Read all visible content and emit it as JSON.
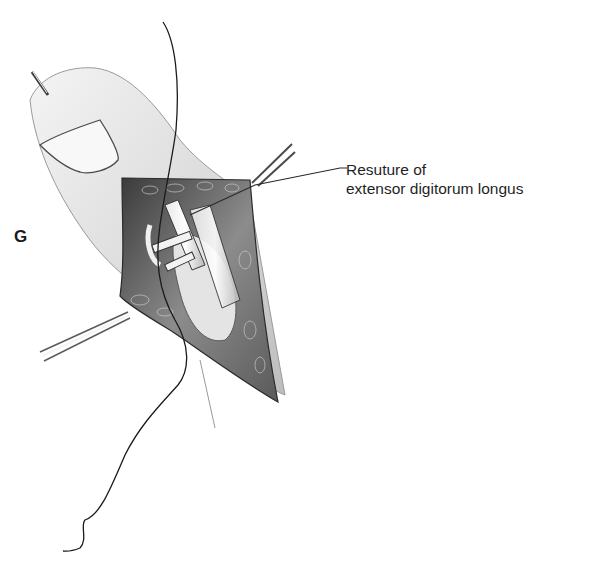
{
  "figure": {
    "panel_letter": "G",
    "annotation": {
      "line1": "Resuture of",
      "line2": "extensor digitorum longus"
    },
    "colors": {
      "background": "#ffffff",
      "ink": "#1a1a1a",
      "shade": "#8a8a8a",
      "wound": "#4a4a4a"
    }
  }
}
